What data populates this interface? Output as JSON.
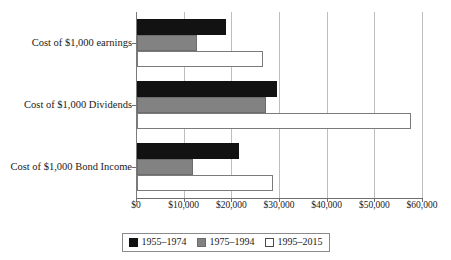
{
  "chart_data": {
    "type": "bar",
    "orientation": "horizontal",
    "title": "",
    "subtitle": "",
    "xlabel": "",
    "ylabel": "",
    "xlim": [
      0,
      60000
    ],
    "xticks": [
      0,
      10000,
      20000,
      30000,
      40000,
      50000,
      60000
    ],
    "xtick_labels": [
      "$0",
      "$10,000",
      "$20,000",
      "$30,000",
      "$40,000",
      "$50,000",
      "$60,000"
    ],
    "grid": true,
    "grid_axis": "x",
    "legend_position": "bottom",
    "categories": [
      "Cost of $1,000 earnings",
      "Cost of $1,000 Dividends",
      "Cost of $1,000 Bond Income"
    ],
    "series": [
      {
        "name": "1955–1974",
        "color": "#121212",
        "values": [
          18700,
          29300,
          21400
        ]
      },
      {
        "name": "1975–1994",
        "color": "#828282",
        "values": [
          12600,
          27000,
          11700
        ]
      },
      {
        "name": "1995–2015",
        "color": "#ffffff",
        "values": [
          26400,
          57400,
          28500
        ]
      }
    ]
  },
  "legend": {
    "items": [
      {
        "label": "1955–1974",
        "swatch": "black-square-swatch"
      },
      {
        "label": "1975–1994",
        "swatch": "gray-square-swatch"
      },
      {
        "label": "1995–2015",
        "swatch": "white-square-swatch"
      }
    ]
  },
  "colors": {
    "series_1955_1974": "#121212",
    "series_1975_1994": "#828282",
    "series_1995_2015": "#ffffff",
    "gridline": "#bdbdbd",
    "axis": "#6e6e6e",
    "text": "#1a1a1a",
    "background": "#ffffff"
  }
}
